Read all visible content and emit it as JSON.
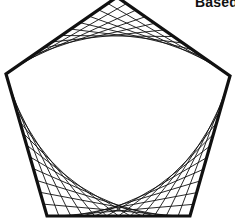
{
  "caption": "Based",
  "figure": {
    "type": "pentagon-string-art",
    "stroke_color": "#111111",
    "outline_width": 3.2,
    "string_width": 0.9,
    "vertices": {
      "top": [
        117,
        -3
      ],
      "right": [
        230,
        76
      ],
      "bottom_right": [
        190,
        216
      ],
      "bottom_left": [
        47,
        216
      ],
      "left": [
        6,
        74
      ]
    },
    "envelopes": [
      {
        "name": "top-envelope",
        "from": "left",
        "corner": "top",
        "to": "right",
        "strings": 12
      },
      {
        "name": "bottom-left-envelope",
        "from": "left",
        "corner": "bottom_left",
        "to": "bottom_right",
        "strings": 12
      },
      {
        "name": "bottom-right-envelope",
        "from": "right",
        "corner": "bottom_right",
        "to": "bottom_left",
        "strings": 12
      }
    ]
  }
}
